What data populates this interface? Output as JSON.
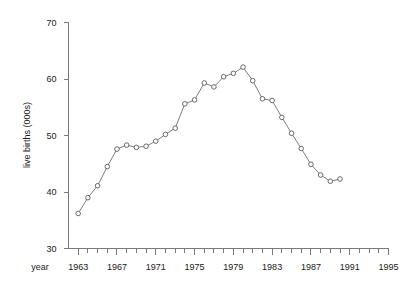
{
  "chart_data": {
    "type": "line",
    "title": "",
    "subtitle": "",
    "xlabel": "year",
    "ylabel": "live births (000s)",
    "xlim": [
      1962,
      1995
    ],
    "ylim": [
      30,
      70
    ],
    "grid": false,
    "legend": "none",
    "x_tick_labels": [
      "1963",
      "1967",
      "1971",
      "1975",
      "1979",
      "1983",
      "1987",
      "1991",
      "1995"
    ],
    "x_tick_values": [
      1963,
      1967,
      1971,
      1975,
      1979,
      1983,
      1987,
      1991,
      1995
    ],
    "x_minor_tick_interval": 1,
    "y_tick_labels": [
      "30",
      "40",
      "50",
      "60",
      "70"
    ],
    "y_tick_values": [
      30,
      40,
      50,
      60,
      70
    ],
    "marker": "open-circle",
    "x": [
      1963,
      1964,
      1965,
      1966,
      1967,
      1968,
      1969,
      1970,
      1971,
      1972,
      1973,
      1974,
      1975,
      1976,
      1977,
      1978,
      1979,
      1980,
      1981,
      1982,
      1983,
      1984,
      1985,
      1986,
      1987,
      1988,
      1989,
      1990
    ],
    "values": [
      36.2,
      39.0,
      41.1,
      44.5,
      47.6,
      48.3,
      47.9,
      48.1,
      49.0,
      50.2,
      51.3,
      55.6,
      56.3,
      59.3,
      58.6,
      60.4,
      61.0,
      62.1,
      59.7,
      56.5,
      56.2,
      53.2,
      50.4,
      47.7,
      44.9,
      43.0,
      41.9,
      42.3
    ],
    "series": [
      {
        "name": "live births",
        "values": [
          36.2,
          39.0,
          41.1,
          44.5,
          47.6,
          48.3,
          47.9,
          48.1,
          49.0,
          50.2,
          51.3,
          55.6,
          56.3,
          59.3,
          58.6,
          60.4,
          61.0,
          62.1,
          59.7,
          56.5,
          56.2,
          53.2,
          50.4,
          47.7,
          44.9,
          43.0,
          41.9,
          42.3
        ]
      }
    ],
    "colors": {
      "line": "#6e6e6e",
      "marker_stroke": "#5a5a5a",
      "marker_fill": "#ffffff",
      "axis": "#7a7a7a",
      "text": "#1a1a1a",
      "background": "#ffffff"
    }
  }
}
